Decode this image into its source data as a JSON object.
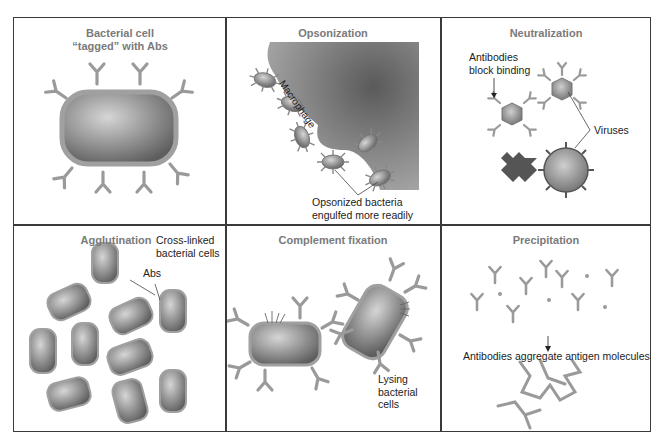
{
  "figure": {
    "panels": [
      {
        "id": "tagged",
        "title_line1": "Bacterial cell",
        "title_line2": "“tagged” with Abs"
      },
      {
        "id": "opsonization",
        "title": "Opsonization",
        "labels": {
          "macrophage": "Macrophage",
          "caption_line1": "Opsonized bacteria",
          "caption_line2": "engulfed more readily"
        }
      },
      {
        "id": "neutralization",
        "title": "Neutralization",
        "labels": {
          "block_line1": "Antibodies",
          "block_line2": "block binding",
          "viruses": "Viruses"
        }
      },
      {
        "id": "agglutination",
        "title": "Agglutination",
        "labels": {
          "crosslinked_line1": "Cross-linked",
          "crosslinked_line2": "bacterial cells",
          "abs": "Abs"
        }
      },
      {
        "id": "complement",
        "title": "Complement fixation",
        "labels": {
          "lysing_line1": "Lysing",
          "lysing_line2": "bacterial",
          "lysing_line3": "cells"
        }
      },
      {
        "id": "precipitation",
        "title": "Precipitation",
        "labels": {
          "caption": "Antibodies aggregate antigen molecules"
        }
      }
    ],
    "colors": {
      "border": "#3a3a3a",
      "title": "#7a7a7a",
      "antibody": "#9a9a9a",
      "cell_fill": "#8c8c8c",
      "macrophage": "#8a8a8a"
    }
  }
}
